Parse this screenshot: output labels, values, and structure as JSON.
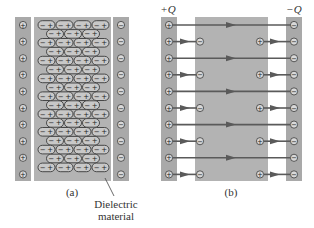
{
  "figure": {
    "panel_a": {
      "caption": "(a)",
      "callout": [
        "Dielectric",
        "material"
      ],
      "left_plate_charge_symbol": "+",
      "right_plate_charge_symbol": "−",
      "dipole_symbols": [
        "−",
        "+"
      ],
      "plate_charge_count": 10,
      "dipole_row_pattern": [
        4,
        3
      ]
    },
    "panel_b": {
      "caption": "(b)",
      "left_plate_label": "+Q",
      "right_plate_label": "−Q",
      "left_plate_charge_symbol": "+",
      "right_plate_charge_symbol": "−",
      "plate_charge_count": 10,
      "induced_negative_symbol": "−",
      "induced_positive_symbol": "+"
    },
    "colors": {
      "plate": "#a9a9a9",
      "dielectric": "#b3b3b3",
      "dipole_fill": "#c8c8c8",
      "outline": "#3a3a3a",
      "field_line": "#5a5a5a"
    }
  }
}
